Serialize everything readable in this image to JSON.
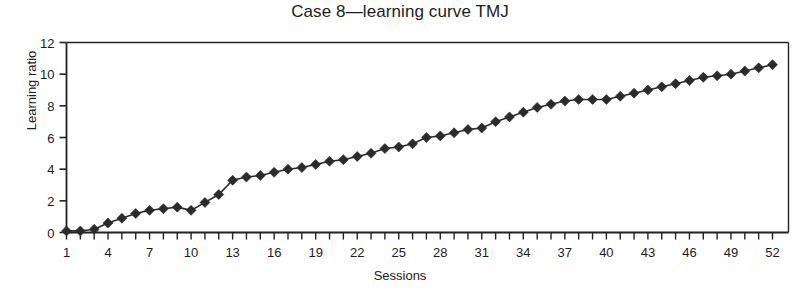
{
  "chart": {
    "title": "Case 8—learning curve TMJ",
    "xlabel": "Sessions",
    "ylabel": "Learning ratio"
  },
  "chart_data": {
    "type": "line",
    "title": "Case 8—learning curve TMJ",
    "xlabel": "Sessions",
    "ylabel": "Learning ratio",
    "xlim": [
      1,
      52
    ],
    "ylim": [
      0,
      12
    ],
    "xticks": [
      1,
      4,
      7,
      10,
      13,
      16,
      19,
      22,
      25,
      28,
      31,
      34,
      37,
      40,
      43,
      46,
      49,
      52
    ],
    "xtick_labels": [
      "1",
      "4",
      "7",
      "10",
      "13",
      "16",
      "19",
      "22",
      "25",
      "28",
      "31",
      "34",
      "37",
      "40",
      "43",
      "46",
      "49",
      "52"
    ],
    "yticks": [
      0,
      2,
      4,
      6,
      8,
      10,
      12
    ],
    "ytick_labels": [
      "0",
      "2",
      "4",
      "6",
      "8",
      "10",
      "12"
    ],
    "grid": false,
    "legend": false,
    "marker": "diamond",
    "marker_color": "#2b2b2b",
    "line_color": "#2b2b2b",
    "x": [
      1,
      2,
      3,
      4,
      5,
      6,
      7,
      8,
      9,
      10,
      11,
      12,
      13,
      14,
      15,
      16,
      17,
      18,
      19,
      20,
      21,
      22,
      23,
      24,
      25,
      26,
      27,
      28,
      29,
      30,
      31,
      32,
      33,
      34,
      35,
      36,
      37,
      38,
      39,
      40,
      41,
      42,
      43,
      44,
      45,
      46,
      47,
      48,
      49,
      50,
      51,
      52
    ],
    "values": [
      0.1,
      0.1,
      0.2,
      0.6,
      0.9,
      1.2,
      1.4,
      1.5,
      1.6,
      1.4,
      1.9,
      2.4,
      3.3,
      3.5,
      3.6,
      3.8,
      4.0,
      4.1,
      4.3,
      4.5,
      4.6,
      4.8,
      5.0,
      5.3,
      5.4,
      5.6,
      6.0,
      6.1,
      6.3,
      6.5,
      6.6,
      7.0,
      7.3,
      7.6,
      7.9,
      8.1,
      8.3,
      8.4,
      8.4,
      8.4,
      8.6,
      8.8,
      9.0,
      9.2,
      9.4,
      9.6,
      9.8,
      9.9,
      10.0,
      10.2,
      10.4,
      10.6
    ],
    "series": [
      {
        "name": "Learning ratio",
        "values": [
          0.1,
          0.1,
          0.2,
          0.6,
          0.9,
          1.2,
          1.4,
          1.5,
          1.6,
          1.4,
          1.9,
          2.4,
          3.3,
          3.5,
          3.6,
          3.8,
          4.0,
          4.1,
          4.3,
          4.5,
          4.6,
          4.8,
          5.0,
          5.3,
          5.4,
          5.6,
          6.0,
          6.1,
          6.3,
          6.5,
          6.6,
          7.0,
          7.3,
          7.6,
          7.9,
          8.1,
          8.3,
          8.4,
          8.4,
          8.4,
          8.6,
          8.8,
          9.0,
          9.2,
          9.4,
          9.6,
          9.8,
          9.9,
          10.0,
          10.2,
          10.4,
          10.6
        ]
      }
    ]
  }
}
